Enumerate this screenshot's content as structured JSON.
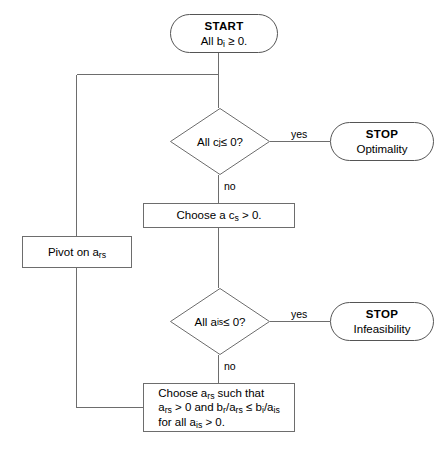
{
  "diagram": {
    "stroke_color": "#6d6d6d",
    "background_color": "#ffffff",
    "text_color": "#000000"
  },
  "nodes": {
    "start": {
      "shape": "terminator",
      "title": "START",
      "subtitle_prefix": "All b",
      "subtitle_sub": "i",
      "subtitle_suffix": " ≥ 0."
    },
    "decision_optimality": {
      "shape": "decision",
      "text_prefix": "All c",
      "text_sub": "j",
      "text_suffix": " ≤ 0?",
      "yes_label": "yes",
      "no_label": "no"
    },
    "stop_optimality": {
      "shape": "terminator",
      "title": "STOP",
      "subtitle": "Optimality"
    },
    "choose_cs": {
      "shape": "process",
      "text_prefix": "Choose a",
      "text_var": "c",
      "text_sub": "s",
      "text_suffix": " > 0."
    },
    "pivot": {
      "shape": "process",
      "text_prefix": "Pivot on",
      "text_var": "a",
      "text_sub": "rs"
    },
    "decision_infeasibility": {
      "shape": "decision",
      "text_prefix": "All a",
      "text_sub": "is",
      "text_suffix": " ≤ 0?",
      "yes_label": "yes",
      "no_label": "no"
    },
    "stop_infeasibility": {
      "shape": "terminator",
      "title": "STOP",
      "subtitle": "Infeasibility"
    },
    "choose_ars": {
      "shape": "process",
      "line1_a": "Choose",
      "line1_var": "a",
      "line1_sub": "rs",
      "line1_b": "such that",
      "line2_v1": "a",
      "line2_s1": "rs",
      "line2_a": " > 0",
      "line2_b": "and",
      "line2_v2": "b",
      "line2_s2": "r",
      "line2_c": "/a",
      "line2_s3": "rs",
      "line2_d": " ≤ b",
      "line2_s4": "i",
      "line2_e": "/a",
      "line2_s5": "is",
      "line3_a": "for all a",
      "line3_s1": "is",
      "line3_b": " > 0."
    }
  }
}
